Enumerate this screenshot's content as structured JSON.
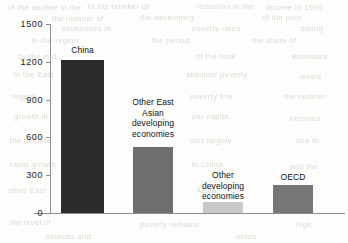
{
  "chart_data": {
    "type": "bar",
    "title": "",
    "subtitle": "",
    "xlabel": "",
    "ylabel": "",
    "grid": false,
    "legend": "none",
    "ylim": [
      0,
      1500
    ],
    "yticks": [
      "0",
      "300",
      "600",
      "900",
      "1200",
      "1500"
    ],
    "ytick_values": [
      0,
      300,
      600,
      900,
      1200,
      1500
    ],
    "categories": [
      "China",
      "Other East Asian developing economies",
      "Other developing economies",
      "OECD"
    ],
    "category_label_lines": [
      [
        "China"
      ],
      [
        "Other East",
        "Asian",
        "developing",
        "economies"
      ],
      [
        "Other",
        "developing",
        "economies"
      ],
      [
        "OECD"
      ]
    ],
    "values": [
      1215,
      525,
      90,
      220
    ],
    "bar_colors": [
      "#2b2b2b",
      "#6f6f6f",
      "#c9c9c9",
      "#767676"
    ],
    "axis_color": "#8e8e8e",
    "text_color": "#101010"
  },
  "chart": {
    "y_ticks": [
      {
        "label": "1500",
        "value": 1500
      },
      {
        "label": "1200",
        "value": 1200
      },
      {
        "label": "900",
        "value": 900
      },
      {
        "label": "600",
        "value": 600
      },
      {
        "label": "300",
        "value": 300
      },
      {
        "label": "0",
        "value": 0
      }
    ],
    "bars": [
      {
        "label": "China",
        "value": 1215,
        "color": "#2b2b2b",
        "left": 61,
        "width": 43,
        "height": 153,
        "label_left": 55,
        "label_width": 55,
        "label_top": 45
      },
      {
        "label": "Other East\nAsian\ndeveloping\neconomies",
        "value": 525,
        "color": "#6f6f6f",
        "left": 133,
        "width": 40,
        "height": 66,
        "label_left": 119,
        "label_width": 68,
        "label_top": 97
      },
      {
        "label": "Other\ndeveloping\neconomies",
        "value": 90,
        "color": "#c9c9c9",
        "left": 203,
        "width": 40,
        "height": 9,
        "label_left": 189,
        "label_width": 68,
        "label_top": 170
      },
      {
        "label": "OECD",
        "value": 220,
        "color": "#767676",
        "left": 273,
        "width": 40,
        "height": 28,
        "label_left": 265,
        "label_width": 56,
        "label_top": 172
      }
    ],
    "bleed_text": [
      {
        "text": "of the decline in the",
        "left": 8,
        "top": 3
      },
      {
        "text": "to the number of",
        "left": 88,
        "top": 2
      },
      {
        "text": "reduction in the",
        "left": 196,
        "top": 2
      },
      {
        "text": "income in 1990",
        "left": 266,
        "top": 3
      },
      {
        "text": "the number of",
        "left": 52,
        "top": 14
      },
      {
        "text": "the developing",
        "left": 140,
        "top": 13
      },
      {
        "text": "of the poor",
        "left": 262,
        "top": 13
      },
      {
        "text": "economies in",
        "left": 62,
        "top": 24
      },
      {
        "text": "poverty rates",
        "left": 192,
        "top": 24
      },
      {
        "text": "during",
        "left": 300,
        "top": 24
      },
      {
        "text": "in the region",
        "left": 32,
        "top": 36
      },
      {
        "text": "the period",
        "left": 152,
        "top": 36
      },
      {
        "text": "the share of",
        "left": 252,
        "top": 36
      },
      {
        "text": "by the mid",
        "left": 18,
        "top": 52
      },
      {
        "text": "of the total",
        "left": 196,
        "top": 52
      },
      {
        "text": "estimates",
        "left": 292,
        "top": 52
      },
      {
        "text": "in the East",
        "left": 14,
        "top": 70
      },
      {
        "text": "absolute poverty",
        "left": 186,
        "top": 70
      },
      {
        "text": "levels",
        "left": 300,
        "top": 72
      },
      {
        "text": "region",
        "left": 12,
        "top": 92
      },
      {
        "text": "poverty line",
        "left": 190,
        "top": 92
      },
      {
        "text": "the number",
        "left": 284,
        "top": 92
      },
      {
        "text": "growth in",
        "left": 14,
        "top": 112
      },
      {
        "text": "per capita",
        "left": 192,
        "top": 112
      },
      {
        "text": "incomes",
        "left": 290,
        "top": 114
      },
      {
        "text": "the decade",
        "left": 10,
        "top": 136
      },
      {
        "text": "was largely",
        "left": 190,
        "top": 136
      },
      {
        "text": "due to",
        "left": 296,
        "top": 136
      },
      {
        "text": "rapid growth",
        "left": 10,
        "top": 160
      },
      {
        "text": "in China",
        "left": 192,
        "top": 160
      },
      {
        "text": "and the",
        "left": 290,
        "top": 162
      },
      {
        "text": "other East",
        "left": 8,
        "top": 186
      },
      {
        "text": "Asian",
        "left": 196,
        "top": 186
      },
      {
        "text": "countries",
        "left": 280,
        "top": 188
      },
      {
        "text": "the level of",
        "left": 10,
        "top": 218
      },
      {
        "text": "poverty remains",
        "left": 140,
        "top": 220
      },
      {
        "text": "high",
        "left": 296,
        "top": 220
      },
      {
        "text": "sources and",
        "left": 46,
        "top": 232
      },
      {
        "text": "notes",
        "left": 236,
        "top": 232
      }
    ]
  }
}
